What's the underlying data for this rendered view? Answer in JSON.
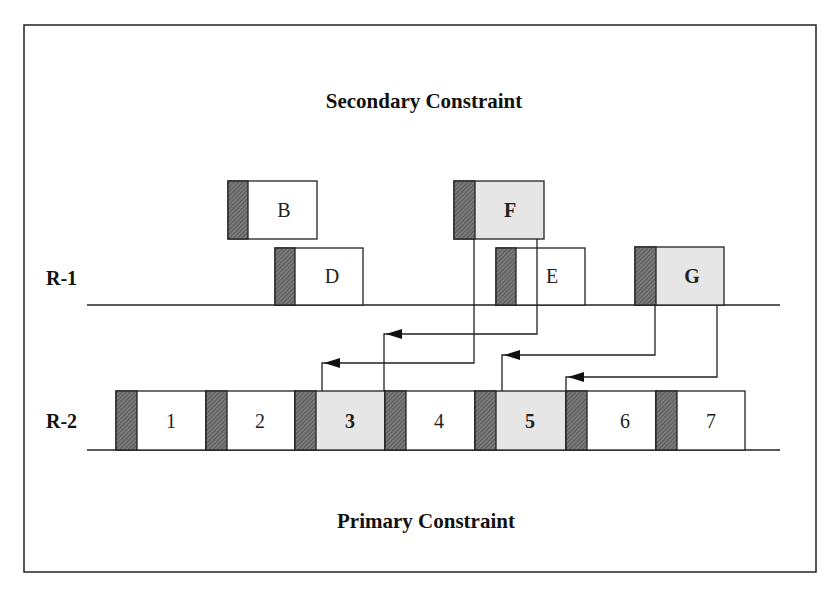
{
  "diagram": {
    "title_top": "Secondary Constraint",
    "title_bottom": "Primary Constraint",
    "colors": {
      "border": "#222222",
      "hatch": "#6e6e6e",
      "highlight_fill": "#e6e6e6",
      "plain_fill": "#ffffff"
    },
    "rows": [
      {
        "id": "R-1",
        "label": "R-1"
      },
      {
        "id": "R-2",
        "label": "R-2"
      }
    ],
    "secondary_boxes": [
      {
        "label": "B",
        "highlighted": false,
        "bold": false,
        "x": 228,
        "y": 181,
        "w": 89,
        "h": 58
      },
      {
        "label": "D",
        "highlighted": false,
        "bold": false,
        "x": 275,
        "y": 248,
        "w": 88,
        "h": 57
      },
      {
        "label": "F",
        "highlighted": true,
        "bold": true,
        "x": 454,
        "y": 181,
        "w": 90,
        "h": 58
      },
      {
        "label": "E",
        "highlighted": false,
        "bold": false,
        "x": 496,
        "y": 248,
        "w": 89,
        "h": 57
      },
      {
        "label": "G",
        "highlighted": true,
        "bold": true,
        "x": 635,
        "y": 247,
        "w": 89,
        "h": 58
      }
    ],
    "primary_blocks": [
      {
        "label": "1",
        "highlighted": false,
        "bold": false
      },
      {
        "label": "2",
        "highlighted": false,
        "bold": false
      },
      {
        "label": "3",
        "highlighted": true,
        "bold": true
      },
      {
        "label": "4",
        "highlighted": false,
        "bold": false
      },
      {
        "label": "5",
        "highlighted": true,
        "bold": true
      },
      {
        "label": "6",
        "highlighted": false,
        "bold": false
      },
      {
        "label": "7",
        "highlighted": false,
        "bold": false
      }
    ],
    "arrows": [
      {
        "from": "F",
        "to": "3"
      },
      {
        "from": "E",
        "to": "4"
      },
      {
        "from": "G",
        "to": "5"
      },
      {
        "from": "G",
        "to": "6"
      }
    ]
  }
}
